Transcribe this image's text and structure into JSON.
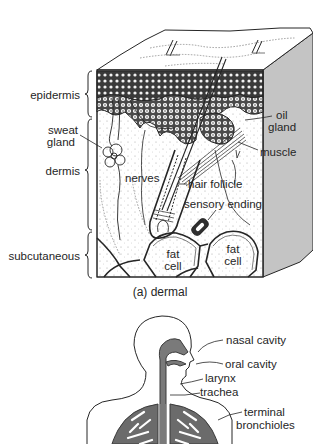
{
  "figure": {
    "panel_a": {
      "caption": "(a) dermal",
      "layers": {
        "epidermis": "epidermis",
        "dermis": "dermis",
        "subcutaneous": "subcutaneous"
      },
      "labels": {
        "sweat_gland_line1": "sweat",
        "sweat_gland_line2": "gland",
        "nerves": "nerves",
        "oil_gland_line1": "oil",
        "oil_gland_line2": "gland",
        "muscle": "muscle",
        "hair_follicle": "hair follicle",
        "sensory_ending": "sensory ending",
        "fat_cell_1_line1": "fat",
        "fat_cell_1_line2": "cell",
        "fat_cell_2_line1": "fat",
        "fat_cell_2_line2": "cell"
      }
    },
    "panel_b": {
      "labels": {
        "nasal_cavity": "nasal cavity",
        "oral_cavity": "oral cavity",
        "larynx": "larynx",
        "trachea": "trachea",
        "terminal_bronchioles_line1": "terminal",
        "terminal_bronchioles_line2": "bronchioles"
      }
    },
    "colors": {
      "line": "#262626",
      "side_face": "#c4c4c4",
      "airway": "#7a7a7a",
      "lung": "#6b6b6b",
      "background": "#ffffff"
    }
  }
}
